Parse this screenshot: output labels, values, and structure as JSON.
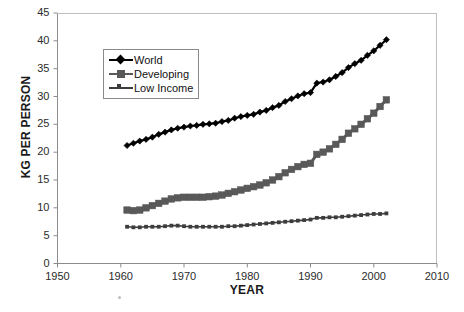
{
  "chart_data": {
    "type": "line",
    "title": "",
    "xlabel": "YEAR",
    "ylabel": "KG PER PERSON",
    "xlim": [
      1950,
      2010
    ],
    "ylim": [
      0,
      45
    ],
    "xticks": [
      1950,
      1960,
      1970,
      1980,
      1990,
      2000,
      2010
    ],
    "yticks": [
      0,
      5,
      10,
      15,
      20,
      25,
      30,
      35,
      40,
      45
    ],
    "grid": false,
    "legend_position": "upper-left-inside",
    "x": [
      1961,
      1962,
      1963,
      1964,
      1965,
      1966,
      1967,
      1968,
      1969,
      1970,
      1971,
      1972,
      1973,
      1974,
      1975,
      1976,
      1977,
      1978,
      1979,
      1980,
      1981,
      1982,
      1983,
      1984,
      1985,
      1986,
      1987,
      1988,
      1989,
      1990,
      1991,
      1992,
      1993,
      1994,
      1995,
      1996,
      1997,
      1998,
      1999,
      2000,
      2001,
      2002
    ],
    "series": [
      {
        "name": "World",
        "marker": "diamond",
        "color": "#000000",
        "values": [
          21.2,
          21.6,
          22.0,
          22.3,
          22.7,
          23.2,
          23.6,
          24.0,
          24.3,
          24.5,
          24.7,
          24.8,
          25.0,
          25.1,
          25.2,
          25.5,
          25.7,
          26.1,
          26.4,
          26.6,
          26.8,
          27.2,
          27.5,
          28.0,
          28.4,
          29.1,
          29.6,
          30.1,
          30.5,
          30.7,
          32.4,
          32.6,
          33.0,
          33.6,
          34.3,
          35.2,
          35.9,
          36.5,
          37.4,
          38.2,
          39.2,
          40.2
        ]
      },
      {
        "name": "Developing",
        "marker": "square",
        "color": "#595959",
        "values": [
          9.6,
          9.5,
          9.6,
          10.0,
          10.4,
          10.8,
          11.2,
          11.6,
          11.8,
          11.9,
          11.9,
          11.9,
          11.9,
          12.0,
          12.1,
          12.3,
          12.6,
          12.9,
          13.2,
          13.5,
          13.8,
          14.1,
          14.5,
          15.0,
          15.6,
          16.3,
          16.9,
          17.4,
          17.8,
          18.0,
          19.6,
          20.0,
          20.6,
          21.4,
          22.3,
          23.4,
          24.2,
          25.0,
          26.0,
          27.0,
          28.2,
          29.4
        ]
      },
      {
        "name": "Low Income",
        "marker": "tick",
        "color": "#3d3d3d",
        "values": [
          6.6,
          6.5,
          6.5,
          6.6,
          6.6,
          6.6,
          6.7,
          6.8,
          6.8,
          6.7,
          6.6,
          6.6,
          6.6,
          6.6,
          6.6,
          6.6,
          6.7,
          6.7,
          6.8,
          6.9,
          7.0,
          7.1,
          7.2,
          7.3,
          7.4,
          7.5,
          7.6,
          7.7,
          7.8,
          7.9,
          8.2,
          8.2,
          8.3,
          8.3,
          8.4,
          8.5,
          8.6,
          8.7,
          8.8,
          8.9,
          8.9,
          9.0
        ]
      }
    ]
  },
  "axes": {
    "y_tick_labels": [
      "45",
      "40",
      "35",
      "30",
      "25",
      "20",
      "15",
      "10",
      "5",
      "0"
    ],
    "x_tick_labels": [
      "1950",
      "1960",
      "1970",
      "1980",
      "1990",
      "2000",
      "2010"
    ],
    "y_title": "KG PER PERSON",
    "x_title": "YEAR"
  },
  "legend": {
    "items": [
      {
        "label": "World"
      },
      {
        "label": "Developing"
      },
      {
        "label": "Low Income"
      }
    ]
  },
  "colors": {
    "world": "#000000",
    "developing": "#595959",
    "low_income": "#3d3d3d",
    "axis": "#808080",
    "text": "#1a1a1a"
  }
}
